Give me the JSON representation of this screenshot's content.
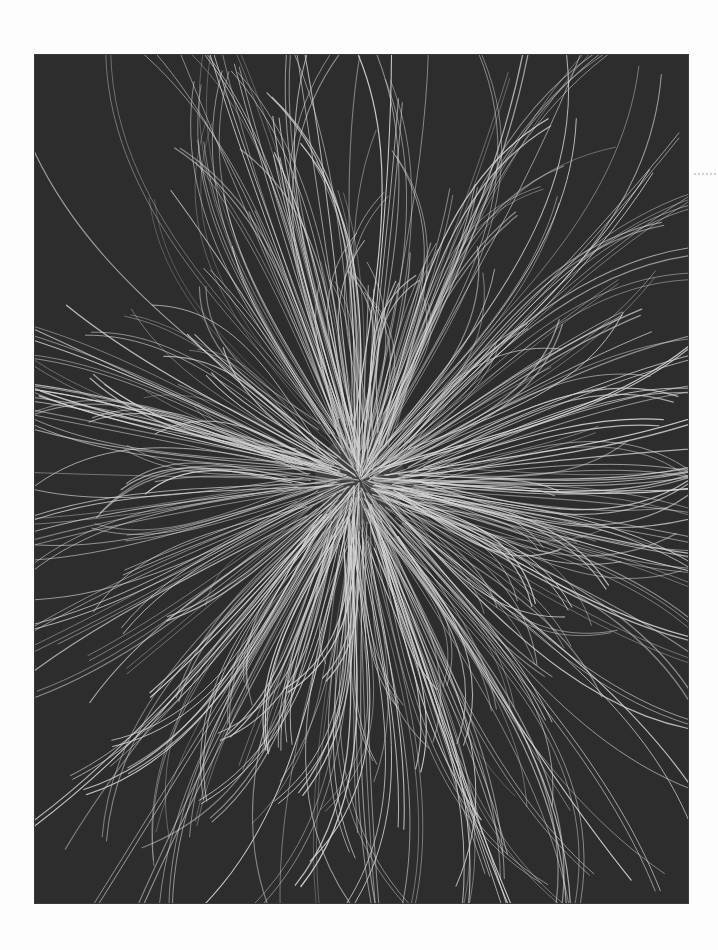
{
  "artwork": {
    "background_color": "#2d2d2d",
    "strand_color": "#d8d8d8",
    "center": {
      "x": 325,
      "y": 425
    },
    "strand_count": 340,
    "seed": 7,
    "inner_radius": [
      0,
      70
    ],
    "outer_radius": [
      180,
      560
    ],
    "curl": 0.55,
    "stroke_width": [
      0.6,
      1.3
    ],
    "opacity": [
      0.45,
      0.95
    ],
    "pair_probability": 0.55,
    "bundle_angles_deg": [
      -112,
      -95,
      -80,
      -62,
      -40,
      -15,
      8,
      22,
      40,
      62,
      78,
      95,
      108,
      125,
      150,
      170,
      195,
      215,
      250
    ]
  },
  "page": {
    "background_color": "#fdfdfd",
    "margin_mark": "dotted-mark"
  }
}
